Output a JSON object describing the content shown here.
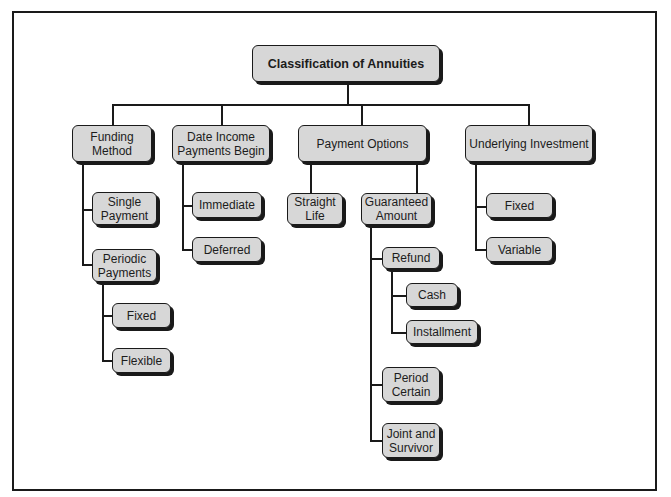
{
  "diagram": {
    "title": "Classification of Annuities",
    "colors": {
      "node_fill": "#d7d7d7",
      "line": "#1a1a1a",
      "background": "#ffffff"
    },
    "root": {
      "label": "Classification of Annuities"
    },
    "categories": [
      {
        "label": "Funding\nMethod",
        "children": [
          {
            "label": "Single\nPayment"
          },
          {
            "label": "Periodic\nPayments",
            "children": [
              {
                "label": "Fixed"
              },
              {
                "label": "Flexible"
              }
            ]
          }
        ]
      },
      {
        "label": "Date Income\nPayments Begin",
        "children": [
          {
            "label": "Immediate"
          },
          {
            "label": "Deferred"
          }
        ]
      },
      {
        "label": "Payment Options",
        "children": [
          {
            "label": "Straight\nLife"
          },
          {
            "label": "Guaranteed\nAmount",
            "children": [
              {
                "label": "Refund",
                "children": [
                  {
                    "label": "Cash"
                  },
                  {
                    "label": "Installment"
                  }
                ]
              },
              {
                "label": "Period\nCertain"
              },
              {
                "label": "Joint and\nSurvivor"
              }
            ]
          }
        ]
      },
      {
        "label": "Underlying Investment",
        "children": [
          {
            "label": "Fixed"
          },
          {
            "label": "Variable"
          }
        ]
      }
    ]
  }
}
